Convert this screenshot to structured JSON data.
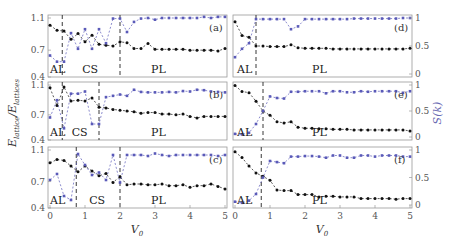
{
  "figure": {
    "ylabel_left": "E_lattice / E_lattice",
    "ylabel_left_display": "Elattice/Elattices",
    "ylabel_right": "S(k)",
    "xlabel": "V0",
    "colors": {
      "energy": "#111111",
      "structure": "#5a5ab8",
      "frame": "#999999",
      "divider": "#222222"
    }
  },
  "chart_data": [
    {
      "panel": "(a)",
      "type": "line",
      "x": [
        0,
        0.2,
        0.4,
        0.6,
        0.8,
        1.0,
        1.2,
        1.4,
        1.6,
        1.8,
        2.0,
        2.2,
        2.4,
        2.6,
        2.8,
        3.0,
        3.2,
        3.4,
        3.6,
        3.8,
        4.0,
        4.2,
        4.4,
        4.6,
        4.8,
        5.0
      ],
      "series": [
        {
          "name": "E_lattice/E_lattice (left axis)",
          "axis": "left",
          "values": [
            1.0,
            0.94,
            0.93,
            0.83,
            0.9,
            0.8,
            0.88,
            0.77,
            0.76,
            0.75,
            0.8,
            0.79,
            0.72,
            0.72,
            0.78,
            0.71,
            0.71,
            0.71,
            0.71,
            0.71,
            0.7,
            0.7,
            0.7,
            0.7,
            0.69,
            0.72
          ]
        },
        {
          "name": "S(k) (right axis)",
          "axis": "right",
          "values": [
            0.33,
            0.22,
            0.22,
            0.73,
            0.45,
            0.8,
            0.45,
            0.8,
            0.55,
            0.99,
            0.99,
            0.75,
            0.93,
            0.99,
            1.0,
            0.97,
            1.0,
            1.0,
            1.0,
            1.0,
            1.0,
            1.0,
            1.02,
            1.0,
            1.02,
            1.02
          ]
        }
      ],
      "left_ylim": [
        0.4,
        1.1
      ],
      "left_yticks": [
        0.4,
        0.7,
        1.1
      ],
      "right_ylim": [
        0,
        1.0
      ],
      "dividers": [
        0.35,
        2.0
      ],
      "regions": [
        "AL",
        "CS",
        "PL"
      ]
    },
    {
      "panel": "(b)",
      "type": "line",
      "x": [
        0,
        0.2,
        0.4,
        0.6,
        0.8,
        1.0,
        1.2,
        1.4,
        1.6,
        1.8,
        2.0,
        2.2,
        2.4,
        2.6,
        2.8,
        3.0,
        3.2,
        3.4,
        3.6,
        3.8,
        4.0,
        4.2,
        4.4,
        4.6,
        4.8,
        5.0
      ],
      "series": [
        {
          "name": "E_lattice/E_lattice (left axis)",
          "axis": "left",
          "values": [
            1.05,
            0.82,
            1.06,
            0.88,
            0.89,
            0.88,
            0.92,
            0.8,
            0.79,
            0.77,
            0.76,
            0.75,
            0.74,
            0.72,
            0.73,
            0.73,
            0.71,
            0.71,
            0.7,
            0.71,
            0.68,
            0.66,
            0.68,
            0.68,
            0.68,
            0.68
          ]
        },
        {
          "name": "S(k) (right axis)",
          "axis": "right",
          "values": [
            0.45,
            0.85,
            0.2,
            1.0,
            1.0,
            1.05,
            0.3,
            0.3,
            0.92,
            0.95,
            0.98,
            0.95,
            1.09,
            1.04,
            1.03,
            1.03,
            1.03,
            1.04,
            1.03,
            1.06,
            1.05,
            1.09,
            1.08,
            1.05,
            1.04,
            1.03
          ]
        }
      ],
      "left_ylim": [
        0.4,
        1.1
      ],
      "left_yticks": [
        0.4,
        0.7,
        1.1
      ],
      "right_ylim": [
        0,
        1.2
      ],
      "dividers": [
        0.35,
        1.4
      ],
      "regions": [
        "AL",
        "CS",
        "PL"
      ]
    },
    {
      "panel": "(c)",
      "type": "line",
      "x": [
        0,
        0.2,
        0.4,
        0.6,
        0.8,
        1.0,
        1.2,
        1.4,
        1.6,
        1.8,
        2.0,
        2.2,
        2.4,
        2.6,
        2.8,
        3.0,
        3.2,
        3.4,
        3.6,
        3.8,
        4.0,
        4.2,
        4.4,
        4.6,
        4.8,
        5.0
      ],
      "series": [
        {
          "name": "E_lattice/E_lattice (left axis)",
          "axis": "left",
          "values": [
            0.93,
            0.97,
            0.96,
            0.89,
            0.82,
            0.89,
            0.83,
            0.77,
            0.8,
            0.69,
            0.76,
            0.66,
            0.67,
            0.67,
            0.66,
            0.66,
            0.67,
            0.65,
            0.65,
            0.66,
            0.63,
            0.65,
            0.65,
            0.67,
            0.64,
            0.61
          ]
        },
        {
          "name": "S(k) (right axis)",
          "axis": "right",
          "values": [
            0.5,
            0.62,
            0.18,
            0.1,
            1.02,
            0.8,
            0.6,
            0.65,
            0.5,
            1.0,
            0.45,
            1.0,
            1.0,
            1.0,
            0.98,
            1.03,
            1.0,
            0.98,
            1.0,
            1.0,
            1.0,
            1.0,
            1.0,
            1.0,
            0.98,
            1.0
          ]
        }
      ],
      "left_ylim": [
        0.4,
        1.1
      ],
      "left_yticks": [
        0.4,
        0.7,
        1.1
      ],
      "right_ylim": [
        0,
        1.1
      ],
      "dividers": [
        0.75,
        2.0
      ],
      "regions": [
        "AL",
        "CS",
        "PL"
      ]
    },
    {
      "panel": "(d)",
      "type": "line",
      "x": [
        0,
        0.2,
        0.4,
        0.6,
        0.8,
        1.0,
        1.2,
        1.4,
        1.6,
        1.8,
        2.0,
        2.2,
        2.4,
        2.6,
        2.8,
        3.0,
        3.2,
        3.4,
        3.6,
        3.8,
        4.0,
        4.2,
        4.4,
        4.6,
        4.8,
        5.0
      ],
      "series": [
        {
          "name": "E_lattice/E_lattice (right panels, left axis)",
          "axis": "left",
          "values": [
            0.92,
            0.68,
            0.65,
            0.5,
            0.5,
            0.49,
            0.49,
            0.49,
            0.52,
            0.47,
            0.46,
            0.46,
            0.46,
            0.46,
            0.45,
            0.45,
            0.45,
            0.45,
            0.45,
            0.45,
            0.45,
            0.45,
            0.45,
            0.45,
            0.45,
            0.46
          ]
        },
        {
          "name": "S(k) (right axis)",
          "axis": "right",
          "values": [
            0.3,
            0.45,
            0.55,
            0.98,
            0.98,
            0.98,
            0.98,
            0.98,
            0.8,
            0.85,
            0.98,
            0.98,
            0.98,
            0.98,
            0.98,
            0.98,
            0.98,
            0.99,
            0.99,
            0.99,
            0.99,
            0.99,
            0.99,
            0.99,
            1.0,
            1.0
          ]
        }
      ],
      "right_ylim": [
        0,
        1
      ],
      "right_yticks": [
        0,
        0.5,
        1
      ],
      "dividers": [
        0.6
      ],
      "regions": [
        "AL",
        "PL"
      ]
    },
    {
      "panel": "(e)",
      "type": "line",
      "x": [
        0,
        0.2,
        0.4,
        0.6,
        0.8,
        1.0,
        1.2,
        1.4,
        1.6,
        1.8,
        2.0,
        2.2,
        2.4,
        2.6,
        2.8,
        3.0,
        3.2,
        3.4,
        3.6,
        3.8,
        4.0,
        4.2,
        4.4,
        4.6,
        4.8,
        5.0
      ],
      "series": [
        {
          "name": "E_lattice/E_lattice (left axis)",
          "axis": "left",
          "values": [
            0.97,
            0.86,
            0.84,
            0.68,
            0.5,
            0.42,
            0.3,
            0.28,
            0.3,
            0.2,
            0.18,
            0.18,
            0.17,
            0.17,
            0.16,
            0.16,
            0.16,
            0.15,
            0.15,
            0.15,
            0.15,
            0.15,
            0.15,
            0.15,
            0.15,
            0.13
          ]
        },
        {
          "name": "S(k) (right axis)",
          "axis": "right",
          "values": [
            0.06,
            0.05,
            0.08,
            0.25,
            0.5,
            0.78,
            0.75,
            0.74,
            0.87,
            0.87,
            0.88,
            0.88,
            0.88,
            0.84,
            0.88,
            0.88,
            0.86,
            0.86,
            0.88,
            0.87,
            0.88,
            0.88,
            0.88,
            0.88,
            0.85,
            0.88
          ]
        }
      ],
      "right_ylim": [
        0,
        1
      ],
      "right_yticks": [
        0,
        0.5,
        1
      ],
      "dividers": [
        0.8
      ],
      "regions": [
        "AL",
        "PL"
      ]
    },
    {
      "panel": "(f)",
      "type": "line",
      "x": [
        0,
        0.2,
        0.4,
        0.6,
        0.8,
        1.0,
        1.2,
        1.4,
        1.6,
        1.8,
        2.0,
        2.2,
        2.4,
        2.6,
        2.8,
        3.0,
        3.2,
        3.4,
        3.6,
        3.8,
        4.0,
        4.2,
        4.4,
        4.6,
        4.8,
        5.0
      ],
      "series": [
        {
          "name": "E_lattice/E_lattice (left axis)",
          "axis": "left",
          "values": [
            0.95,
            0.85,
            0.7,
            0.58,
            0.52,
            0.45,
            0.28,
            0.27,
            0.27,
            0.2,
            0.2,
            0.2,
            0.16,
            0.17,
            0.17,
            0.16,
            0.16,
            0.16,
            0.13,
            0.13,
            0.13,
            0.13,
            0.13,
            0.12,
            0.13,
            0.13
          ]
        },
        {
          "name": "S(k) (right axis)",
          "axis": "right",
          "values": [
            0.06,
            0.04,
            0.08,
            0.2,
            0.5,
            0.8,
            0.78,
            0.76,
            0.88,
            0.88,
            0.89,
            0.89,
            0.88,
            0.86,
            0.9,
            0.9,
            0.86,
            0.86,
            0.9,
            0.9,
            0.88,
            0.9,
            0.9,
            0.9,
            0.88,
            0.88
          ]
        }
      ],
      "right_ylim": [
        0,
        1
      ],
      "right_yticks": [
        0,
        0.5,
        1
      ],
      "dividers": [
        0.75
      ],
      "regions": [
        "AL",
        "PL"
      ]
    }
  ],
  "axes": {
    "x_ticks": [
      0,
      1,
      2,
      3,
      4,
      5
    ],
    "x_tick_labels": [
      "0",
      "1",
      "2",
      "3",
      "4",
      "5"
    ],
    "left_y_tick_labels": [
      "1.1",
      "0.7",
      "0.4"
    ],
    "right_y_tick_labels": [
      "1",
      "0.5",
      "0"
    ]
  }
}
